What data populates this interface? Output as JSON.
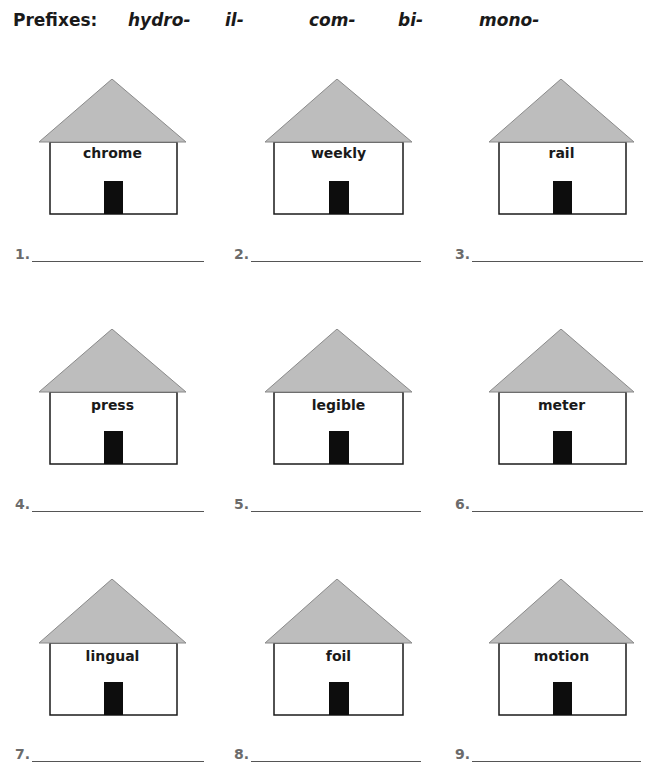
{
  "header": {
    "title": "Prefixes:",
    "prefixes": [
      "hydro-",
      "il-",
      "com-",
      "bi-",
      "mono-"
    ]
  },
  "colors": {
    "roof_fill": "#bdbdbd",
    "roof_stroke": "#8a8a8a",
    "wall_stroke": "#1a1a1a",
    "door_fill": "#0d0d0d",
    "number_color": "#6b6b6b",
    "line_color": "#555555"
  },
  "houses": [
    {
      "number": "1.",
      "word": "chrome",
      "answer": ""
    },
    {
      "number": "2.",
      "word": "weekly",
      "answer": ""
    },
    {
      "number": "3.",
      "word": "rail",
      "answer": ""
    },
    {
      "number": "4.",
      "word": "press",
      "answer": ""
    },
    {
      "number": "5.",
      "word": "legible",
      "answer": ""
    },
    {
      "number": "6.",
      "word": "meter",
      "answer": ""
    },
    {
      "number": "7.",
      "word": "lingual",
      "answer": ""
    },
    {
      "number": "8.",
      "word": "foil",
      "answer": ""
    },
    {
      "number": "9.",
      "word": "motion",
      "answer": ""
    }
  ]
}
